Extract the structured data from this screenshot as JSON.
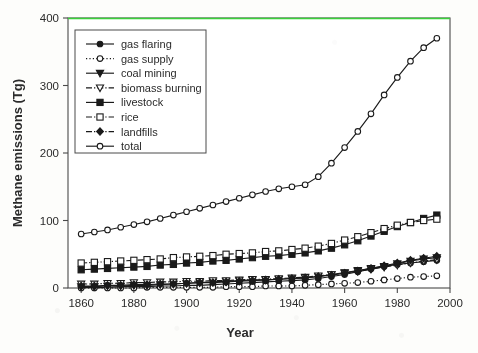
{
  "chart_data": {
    "type": "line",
    "title": "",
    "xlabel": "Year",
    "ylabel": "Methane emissions (Tg)",
    "xlim": [
      1855,
      2000
    ],
    "ylim": [
      0,
      400
    ],
    "xticks": [
      1860,
      1880,
      1900,
      1920,
      1940,
      1960,
      1980,
      2000
    ],
    "xticklabels": [
      "1860",
      "1880",
      "1900",
      "1920",
      "1940",
      "1960",
      "1980",
      "2000"
    ],
    "yticks": [
      0,
      100,
      200,
      300,
      400
    ],
    "yticklabels": [
      "0",
      "100",
      "200",
      "300",
      "400"
    ],
    "grid": false,
    "legend_position": "upper-left-inside",
    "annotations": [
      {
        "name": "green-reference-line",
        "type": "hline",
        "y": 400,
        "color": "#3ad13a"
      }
    ],
    "x": [
      1860,
      1865,
      1870,
      1875,
      1880,
      1885,
      1890,
      1895,
      1900,
      1905,
      1910,
      1915,
      1920,
      1925,
      1930,
      1935,
      1940,
      1945,
      1950,
      1955,
      1960,
      1965,
      1970,
      1975,
      1980,
      1985,
      1990,
      1995
    ],
    "series": [
      {
        "name": "gas flaring",
        "marker": "filled-circle",
        "linestyle": "solid",
        "color": "#1a1a1a",
        "values": [
          1,
          1,
          1,
          2,
          2,
          2,
          3,
          3,
          4,
          4,
          5,
          6,
          7,
          8,
          9,
          10,
          11,
          12,
          14,
          17,
          20,
          24,
          28,
          32,
          35,
          37,
          39,
          41
        ]
      },
      {
        "name": "gas supply",
        "marker": "open-circle",
        "linestyle": "dotted",
        "color": "#1a1a1a",
        "values": [
          0,
          0,
          0,
          0,
          0,
          1,
          1,
          1,
          1,
          1,
          1,
          2,
          2,
          2,
          3,
          3,
          3,
          4,
          5,
          6,
          7,
          8,
          10,
          12,
          14,
          16,
          17,
          18
        ]
      },
      {
        "name": "coal mining",
        "marker": "filled-down-triangle",
        "linestyle": "solid",
        "color": "#1a1a1a",
        "values": [
          2,
          2,
          3,
          3,
          4,
          4,
          5,
          6,
          7,
          8,
          9,
          10,
          11,
          12,
          12,
          13,
          14,
          15,
          17,
          20,
          23,
          26,
          29,
          32,
          36,
          40,
          43,
          45
        ]
      },
      {
        "name": "biomass burning",
        "marker": "open-down-triangle",
        "linestyle": "dash-dot",
        "color": "#1a1a1a",
        "values": [
          6,
          6,
          7,
          7,
          8,
          8,
          9,
          9,
          10,
          10,
          11,
          11,
          12,
          13,
          13,
          14,
          15,
          16,
          18,
          20,
          22,
          25,
          28,
          31,
          34,
          37,
          40,
          42
        ]
      },
      {
        "name": "livestock",
        "marker": "filled-square",
        "linestyle": "solid",
        "color": "#1a1a1a",
        "values": [
          27,
          28,
          29,
          30,
          31,
          32,
          34,
          35,
          37,
          38,
          40,
          41,
          43,
          45,
          47,
          48,
          50,
          52,
          55,
          59,
          64,
          70,
          77,
          84,
          91,
          97,
          103,
          108
        ]
      },
      {
        "name": "rice",
        "marker": "open-square",
        "linestyle": "dash-dot",
        "color": "#1a1a1a",
        "values": [
          37,
          38,
          39,
          40,
          41,
          42,
          43,
          45,
          46,
          47,
          48,
          50,
          51,
          52,
          54,
          55,
          57,
          59,
          62,
          66,
          71,
          76,
          82,
          88,
          93,
          97,
          100,
          102
        ]
      },
      {
        "name": "landfills",
        "marker": "filled-diamond",
        "linestyle": "solid",
        "color": "#1a1a1a",
        "values": [
          3,
          3,
          4,
          4,
          5,
          5,
          6,
          6,
          7,
          8,
          8,
          9,
          10,
          11,
          12,
          13,
          14,
          15,
          17,
          19,
          22,
          25,
          29,
          33,
          37,
          41,
          44,
          47
        ]
      },
      {
        "name": "total",
        "marker": "open-circle",
        "linestyle": "solid",
        "color": "#1a1a1a",
        "values": [
          80,
          83,
          86,
          90,
          94,
          98,
          103,
          108,
          113,
          118,
          123,
          128,
          133,
          138,
          143,
          147,
          150,
          153,
          165,
          185,
          208,
          232,
          258,
          286,
          312,
          336,
          356,
          370
        ]
      }
    ],
    "legend_entries": [
      {
        "label": "gas flaring",
        "marker": "filled-circle",
        "linestyle": "solid"
      },
      {
        "label": "gas supply",
        "marker": "open-circle",
        "linestyle": "dotted"
      },
      {
        "label": "coal mining",
        "marker": "filled-down-triangle",
        "linestyle": "solid"
      },
      {
        "label": "biomass burning",
        "marker": "open-down-triangle",
        "linestyle": "dash-dot"
      },
      {
        "label": "livestock",
        "marker": "filled-square",
        "linestyle": "solid"
      },
      {
        "label": "rice",
        "marker": "open-square",
        "linestyle": "dash-dot"
      },
      {
        "label": "landfills",
        "marker": "filled-diamond",
        "linestyle": "dash-dot"
      },
      {
        "label": "total",
        "marker": "open-circle",
        "linestyle": "solid"
      }
    ]
  }
}
